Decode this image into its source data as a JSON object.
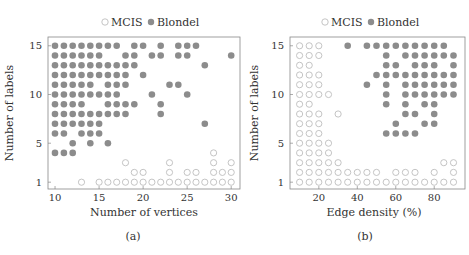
{
  "colors": {
    "blondel_fill": "#8c8c8c",
    "mcis_stroke": "#bdbdbd",
    "frame": "#888888"
  },
  "chart_data": [
    {
      "type": "scatter",
      "caption": "(a)",
      "legend": [
        "MCIS",
        "Blondel"
      ],
      "xlabel": "Number of vertices",
      "ylabel": "Number of labels",
      "xticks": [
        10,
        15,
        20,
        25,
        30
      ],
      "yticks": [
        1,
        5,
        10,
        15
      ],
      "xlim": [
        9.2,
        31
      ],
      "ylim": [
        0.3,
        15.9
      ],
      "series": [
        {
          "name": "Blondel",
          "marker": "filled-circle",
          "points": [
            [
              10,
              15
            ],
            [
              11,
              15
            ],
            [
              12,
              15
            ],
            [
              13,
              15
            ],
            [
              14,
              15
            ],
            [
              15,
              15
            ],
            [
              16,
              15
            ],
            [
              17,
              15
            ],
            [
              19,
              15
            ],
            [
              20,
              15
            ],
            [
              22,
              15
            ],
            [
              24,
              15
            ],
            [
              25,
              15
            ],
            [
              26,
              15
            ],
            [
              10,
              14
            ],
            [
              11,
              14
            ],
            [
              12,
              14
            ],
            [
              13,
              14
            ],
            [
              14,
              14
            ],
            [
              15,
              14
            ],
            [
              18,
              14
            ],
            [
              19,
              14
            ],
            [
              21,
              14
            ],
            [
              22,
              14
            ],
            [
              24,
              14
            ],
            [
              25,
              14
            ],
            [
              30,
              14
            ],
            [
              10,
              13
            ],
            [
              11,
              13
            ],
            [
              12,
              13
            ],
            [
              13,
              13
            ],
            [
              14,
              13
            ],
            [
              15,
              13
            ],
            [
              16,
              13
            ],
            [
              17,
              13
            ],
            [
              18,
              13
            ],
            [
              19,
              13
            ],
            [
              27,
              13
            ],
            [
              10,
              12
            ],
            [
              11,
              12
            ],
            [
              12,
              12
            ],
            [
              13,
              12
            ],
            [
              14,
              12
            ],
            [
              15,
              12
            ],
            [
              16,
              12
            ],
            [
              17,
              12
            ],
            [
              18,
              12
            ],
            [
              20,
              12
            ],
            [
              10,
              11
            ],
            [
              11,
              11
            ],
            [
              12,
              11
            ],
            [
              13,
              11
            ],
            [
              14,
              11
            ],
            [
              16,
              11
            ],
            [
              17,
              11
            ],
            [
              18,
              11
            ],
            [
              23,
              11
            ],
            [
              24,
              11
            ],
            [
              10,
              10
            ],
            [
              11,
              10
            ],
            [
              12,
              10
            ],
            [
              13,
              10
            ],
            [
              14,
              10
            ],
            [
              15,
              10
            ],
            [
              16,
              10
            ],
            [
              17,
              10
            ],
            [
              21,
              10
            ],
            [
              25,
              10
            ],
            [
              10,
              9
            ],
            [
              11,
              9
            ],
            [
              12,
              9
            ],
            [
              13,
              9
            ],
            [
              16,
              9
            ],
            [
              17,
              9
            ],
            [
              18,
              9
            ],
            [
              19,
              9
            ],
            [
              22,
              9
            ],
            [
              10,
              8
            ],
            [
              11,
              8
            ],
            [
              12,
              8
            ],
            [
              13,
              8
            ],
            [
              14,
              8
            ],
            [
              15,
              8
            ],
            [
              16,
              8
            ],
            [
              17,
              8
            ],
            [
              18,
              8
            ],
            [
              22,
              8
            ],
            [
              10,
              7
            ],
            [
              11,
              7
            ],
            [
              12,
              7
            ],
            [
              13,
              7
            ],
            [
              14,
              7
            ],
            [
              15,
              7
            ],
            [
              27,
              7
            ],
            [
              10,
              6
            ],
            [
              11,
              6
            ],
            [
              13,
              6
            ],
            [
              14,
              6
            ],
            [
              15,
              6
            ],
            [
              12,
              5
            ],
            [
              14,
              5
            ],
            [
              16,
              5
            ],
            [
              10,
              4
            ],
            [
              11,
              4
            ],
            [
              12,
              4
            ]
          ]
        },
        {
          "name": "MCIS",
          "marker": "open-circle",
          "points": [
            [
              28,
              4
            ],
            [
              18,
              3
            ],
            [
              23,
              3
            ],
            [
              28,
              3
            ],
            [
              30,
              3
            ],
            [
              19,
              2
            ],
            [
              20,
              2
            ],
            [
              23,
              2
            ],
            [
              25,
              2
            ],
            [
              26,
              2
            ],
            [
              28,
              2
            ],
            [
              29,
              2
            ],
            [
              30,
              2
            ],
            [
              13,
              1
            ],
            [
              15,
              1
            ],
            [
              16,
              1
            ],
            [
              17,
              1
            ],
            [
              18,
              1
            ],
            [
              19,
              1
            ],
            [
              20,
              1
            ],
            [
              21,
              1
            ],
            [
              22,
              1
            ],
            [
              23,
              1
            ],
            [
              24,
              1
            ],
            [
              25,
              1
            ],
            [
              26,
              1
            ],
            [
              27,
              1
            ],
            [
              28,
              1
            ],
            [
              29,
              1
            ],
            [
              30,
              1
            ]
          ]
        }
      ]
    },
    {
      "type": "scatter",
      "caption": "(b)",
      "legend": [
        "MCIS",
        "Blondel"
      ],
      "xlabel": "Edge density (%)",
      "ylabel": "Number of labels",
      "xticks": [
        20,
        40,
        60,
        80
      ],
      "yticks": [
        1,
        5,
        10,
        15
      ],
      "xlim": [
        5,
        96
      ],
      "ylim": [
        0.3,
        15.9
      ],
      "series": [
        {
          "name": "Blondel",
          "marker": "filled-circle",
          "points": [
            [
              35,
              15
            ],
            [
              45,
              15
            ],
            [
              50,
              15
            ],
            [
              55,
              15
            ],
            [
              60,
              15
            ],
            [
              65,
              15
            ],
            [
              70,
              15
            ],
            [
              75,
              15
            ],
            [
              80,
              15
            ],
            [
              85,
              15
            ],
            [
              55,
              14
            ],
            [
              65,
              14
            ],
            [
              70,
              14
            ],
            [
              75,
              14
            ],
            [
              80,
              14
            ],
            [
              85,
              14
            ],
            [
              90,
              14
            ],
            [
              55,
              13
            ],
            [
              60,
              13
            ],
            [
              70,
              13
            ],
            [
              75,
              13
            ],
            [
              80,
              13
            ],
            [
              90,
              13
            ],
            [
              50,
              12
            ],
            [
              55,
              12
            ],
            [
              60,
              12
            ],
            [
              65,
              12
            ],
            [
              70,
              12
            ],
            [
              75,
              12
            ],
            [
              80,
              12
            ],
            [
              85,
              12
            ],
            [
              90,
              12
            ],
            [
              45,
              11
            ],
            [
              55,
              11
            ],
            [
              65,
              11
            ],
            [
              70,
              11
            ],
            [
              75,
              11
            ],
            [
              80,
              11
            ],
            [
              85,
              11
            ],
            [
              90,
              11
            ],
            [
              55,
              10
            ],
            [
              65,
              10
            ],
            [
              70,
              10
            ],
            [
              75,
              10
            ],
            [
              80,
              10
            ],
            [
              85,
              10
            ],
            [
              90,
              10
            ],
            [
              55,
              9
            ],
            [
              65,
              9
            ],
            [
              75,
              9
            ],
            [
              80,
              9
            ],
            [
              65,
              8
            ],
            [
              70,
              8
            ],
            [
              80,
              8
            ],
            [
              60,
              7
            ],
            [
              75,
              7
            ],
            [
              80,
              7
            ],
            [
              55,
              6
            ],
            [
              60,
              6
            ],
            [
              65,
              6
            ],
            [
              70,
              6
            ]
          ]
        },
        {
          "name": "MCIS",
          "marker": "open-circle",
          "points": [
            [
              10,
              15
            ],
            [
              15,
              15
            ],
            [
              20,
              15
            ],
            [
              10,
              14
            ],
            [
              15,
              14
            ],
            [
              20,
              14
            ],
            [
              10,
              13
            ],
            [
              15,
              13
            ],
            [
              10,
              12
            ],
            [
              15,
              12
            ],
            [
              20,
              12
            ],
            [
              10,
              11
            ],
            [
              15,
              11
            ],
            [
              20,
              11
            ],
            [
              10,
              10
            ],
            [
              15,
              10
            ],
            [
              20,
              10
            ],
            [
              25,
              10
            ],
            [
              10,
              9
            ],
            [
              15,
              9
            ],
            [
              10,
              8
            ],
            [
              15,
              8
            ],
            [
              20,
              8
            ],
            [
              30,
              8
            ],
            [
              10,
              7
            ],
            [
              15,
              7
            ],
            [
              20,
              7
            ],
            [
              10,
              6
            ],
            [
              15,
              6
            ],
            [
              20,
              6
            ],
            [
              10,
              5
            ],
            [
              15,
              5
            ],
            [
              20,
              5
            ],
            [
              25,
              5
            ],
            [
              10,
              4
            ],
            [
              15,
              4
            ],
            [
              20,
              4
            ],
            [
              25,
              4
            ],
            [
              10,
              3
            ],
            [
              15,
              3
            ],
            [
              20,
              3
            ],
            [
              25,
              3
            ],
            [
              30,
              3
            ],
            [
              85,
              3
            ],
            [
              90,
              3
            ],
            [
              10,
              2
            ],
            [
              15,
              2
            ],
            [
              20,
              2
            ],
            [
              25,
              2
            ],
            [
              30,
              2
            ],
            [
              35,
              2
            ],
            [
              40,
              2
            ],
            [
              45,
              2
            ],
            [
              50,
              2
            ],
            [
              60,
              2
            ],
            [
              65,
              2
            ],
            [
              70,
              2
            ],
            [
              80,
              2
            ],
            [
              90,
              2
            ],
            [
              10,
              1
            ],
            [
              15,
              1
            ],
            [
              20,
              1
            ],
            [
              25,
              1
            ],
            [
              30,
              1
            ],
            [
              35,
              1
            ],
            [
              40,
              1
            ],
            [
              45,
              1
            ],
            [
              50,
              1
            ],
            [
              55,
              1
            ],
            [
              60,
              1
            ],
            [
              65,
              1
            ],
            [
              70,
              1
            ],
            [
              75,
              1
            ],
            [
              80,
              1
            ],
            [
              85,
              1
            ],
            [
              90,
              1
            ]
          ]
        }
      ]
    }
  ],
  "layout_frames": [
    {
      "left": 48,
      "top": 37,
      "right": 240,
      "bottom": 189
    },
    {
      "left": 290,
      "top": 37,
      "right": 465,
      "bottom": 189
    }
  ]
}
